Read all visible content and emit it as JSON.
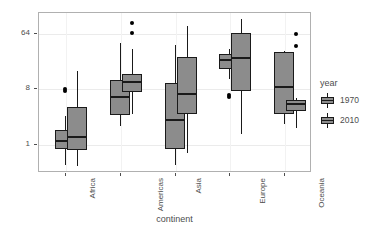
{
  "chart_data": {
    "type": "boxplot",
    "title": "",
    "xlabel": "continent",
    "ylabel": "Income in dollars per day",
    "categories": [
      "Africa",
      "Americas",
      "Asia",
      "Europe",
      "Oceania"
    ],
    "y_scale": "log2",
    "y_ticks": [
      1,
      8,
      64
    ],
    "y_tick_labels": [
      "1",
      "8",
      "64"
    ],
    "ylim": [
      0.35,
      140
    ],
    "grid": true,
    "legend": {
      "title": "year",
      "position": "right",
      "entries": [
        {
          "label": "1970",
          "fill": "#8c8c8c"
        },
        {
          "label": "2010",
          "fill": "#8c8c8c"
        }
      ]
    },
    "series": [
      {
        "name": "1970",
        "boxes": [
          {
            "category": "Africa",
            "lower_whisker": 0.48,
            "q1": 0.85,
            "median": 1.15,
            "q3": 1.75,
            "upper_whisker": 3.0,
            "outliers": [
              7.6,
              8.2
            ]
          },
          {
            "category": "Americas",
            "lower_whisker": 2.0,
            "q1": 3.1,
            "median": 6.0,
            "q3": 11.5,
            "upper_whisker": 45.0,
            "outliers": []
          },
          {
            "category": "Asia",
            "lower_whisker": 0.48,
            "q1": 0.85,
            "median": 2.5,
            "q3": 10.0,
            "upper_whisker": 42.0,
            "outliers": []
          },
          {
            "category": "Europe",
            "lower_whisker": 12.0,
            "q1": 17.0,
            "median": 24.0,
            "q3": 30.0,
            "upper_whisker": 36.0,
            "outliers": [
              6.0,
              6.6
            ]
          },
          {
            "category": "Oceania",
            "lower_whisker": 2.2,
            "q1": 3.2,
            "median": 8.8,
            "q3": 32.0,
            "upper_whisker": 34.0,
            "outliers": []
          }
        ]
      },
      {
        "name": "2010",
        "boxes": [
          {
            "category": "Africa",
            "lower_whisker": 0.45,
            "q1": 0.82,
            "median": 1.35,
            "q3": 4.2,
            "upper_whisker": 16.0,
            "outliers": []
          },
          {
            "category": "Americas",
            "lower_whisker": 3.2,
            "q1": 7.4,
            "median": 10.5,
            "q3": 14.5,
            "upper_whisker": 36.0,
            "outliers": [
              66.0,
              96.0
            ]
          },
          {
            "category": "Asia",
            "lower_whisker": 0.75,
            "q1": 3.2,
            "median": 6.8,
            "q3": 27.0,
            "upper_whisker": 85.0,
            "outliers": []
          },
          {
            "category": "Europe",
            "lower_whisker": 1.5,
            "q1": 7.6,
            "median": 26.0,
            "q3": 65.0,
            "upper_whisker": 110.0,
            "outliers": []
          },
          {
            "category": "Oceania",
            "lower_whisker": 1.9,
            "q1": 3.6,
            "median": 4.7,
            "q3": 5.4,
            "upper_whisker": 5.8,
            "outliers": [
              40.0,
              64.0
            ]
          }
        ]
      }
    ]
  }
}
